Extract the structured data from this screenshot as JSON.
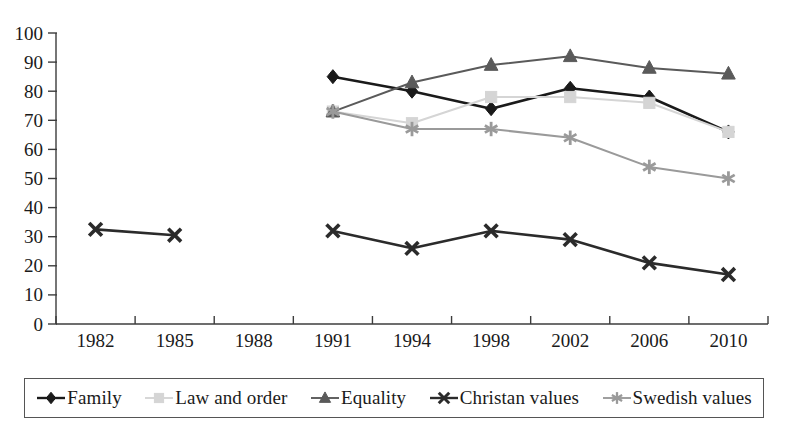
{
  "chart_data": {
    "type": "line",
    "title": "",
    "xlabel": "",
    "ylabel": "",
    "categories": [
      "1982",
      "1985",
      "1988",
      "1991",
      "1994",
      "1998",
      "2002",
      "2006",
      "2010"
    ],
    "ylim": [
      0,
      100
    ],
    "yticks": [
      "0",
      "10",
      "20",
      "30",
      "40",
      "50",
      "60",
      "70",
      "80",
      "90",
      "100"
    ],
    "grid": false,
    "legend_position": "bottom",
    "series": [
      {
        "name": "Family",
        "marker": "diamond",
        "color": "#1a1a1a",
        "values": [
          null,
          null,
          null,
          85,
          80,
          74,
          81,
          78,
          66
        ]
      },
      {
        "name": "Law and order",
        "marker": "square",
        "color": "#d5d5d5",
        "values": [
          null,
          null,
          null,
          73,
          69,
          78,
          78,
          76,
          66
        ]
      },
      {
        "name": "Equality",
        "marker": "triangle",
        "color": "#5a5a5a",
        "values": [
          null,
          null,
          null,
          73,
          83,
          89,
          92,
          88,
          86
        ]
      },
      {
        "name": "Christan values",
        "marker": "x",
        "color": "#2b2b2b",
        "values": [
          32.5,
          30.5,
          null,
          32,
          26,
          32,
          29,
          21,
          17
        ]
      },
      {
        "name": "Swedish values",
        "marker": "asterisk",
        "color": "#9a9a9a",
        "values": [
          null,
          null,
          null,
          73,
          67,
          67,
          64,
          54,
          50
        ]
      }
    ]
  },
  "legend": {
    "items": [
      {
        "label": "Family",
        "marker": "diamond",
        "color": "#1a1a1a"
      },
      {
        "label": "Law and order",
        "marker": "square",
        "color": "#d5d5d5"
      },
      {
        "label": "Equality",
        "marker": "triangle",
        "color": "#5a5a5a"
      },
      {
        "label": "Christan values",
        "marker": "x",
        "color": "#2b2b2b"
      },
      {
        "label": "Swedish values",
        "marker": "asterisk",
        "color": "#9a9a9a"
      }
    ]
  },
  "axis": {
    "y_min_label": "0",
    "y_max_label": "100"
  }
}
